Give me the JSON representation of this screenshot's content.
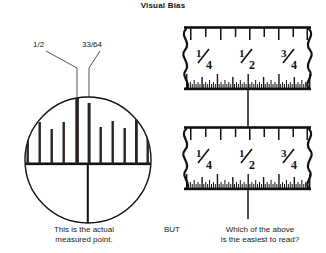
{
  "figure": {
    "title": "Visual Bias",
    "type": "technical-illustration"
  },
  "callouts": {
    "half": "1/2",
    "thirty_three_sixty_fourths": "33/64"
  },
  "captions": {
    "left": "This is the actual\nmeasured point.",
    "left_line1": "This is the actual",
    "left_line2": "measured point.",
    "conjunction": "BUT",
    "right_line1": "Which of the above",
    "right_line2": "is the easiest to read?"
  },
  "magnifier": {
    "name": "magnified-ruler-detail",
    "description": "Circular magnified view of ruler graduations around the 1/2 inch mark",
    "center_x": 88,
    "center_y": 160,
    "radius": 63,
    "baseline_y": 164,
    "major_tick_label": "1/2",
    "measured_point_label": "33/64"
  },
  "rulers": [
    {
      "name": "ruler-top",
      "index": 1,
      "fraction_labels": [
        "1/4",
        "1/2",
        "3/4"
      ],
      "coarse_divisions": 8,
      "fine_divisions": 64,
      "broken_ends": true
    },
    {
      "name": "ruler-bottom",
      "index": 2,
      "fraction_labels": [
        "1/4",
        "1/2",
        "3/4"
      ],
      "coarse_divisions": 8,
      "fine_divisions": 64,
      "broken_ends": true
    }
  ],
  "pointer": {
    "name": "measured-point-pointer",
    "x": 248,
    "label": "measured point indicator"
  },
  "colors": {
    "ink": "#1a1a1a",
    "background": "#ffffff",
    "line": "#111111"
  }
}
